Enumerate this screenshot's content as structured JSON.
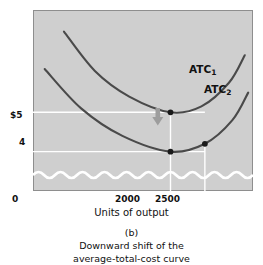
{
  "chart_data": {
    "type": "line",
    "title": "",
    "subtitle": "",
    "panel_label": "(b)",
    "caption_line1": "Downward shift of the",
    "caption_line2": "average-total-cost curve",
    "xlabel": "Units of output",
    "ylabel": "",
    "x_ticks": [
      "0",
      "2000",
      "2500"
    ],
    "x_tick_values": [
      0,
      2000,
      2500
    ],
    "y_ticks": [
      "$5",
      "4"
    ],
    "y_tick_values": [
      5,
      4
    ],
    "xlim": [
      0,
      3200
    ],
    "ylim": [
      3.0,
      7.6
    ],
    "grid": true,
    "grid_color": "#ffffff",
    "plot_background": "#cfcfcf",
    "axis_break": "wavy-line",
    "legend_position": "inline-right",
    "curve_color": "#4a4a4a",
    "arrow_color": "#9a9a9a",
    "series": [
      {
        "name": "ATC1",
        "label": "ATC",
        "subscript": "1",
        "points": [
          {
            "x": 450,
            "y": 7.05
          },
          {
            "x": 900,
            "y": 6.05
          },
          {
            "x": 1400,
            "y": 5.4
          },
          {
            "x": 2000,
            "y": 5.0
          },
          {
            "x": 2450,
            "y": 5.15
          },
          {
            "x": 2850,
            "y": 5.75
          },
          {
            "x": 3080,
            "y": 6.45
          }
        ]
      },
      {
        "name": "ATC2",
        "label": "ATC",
        "subscript": "2",
        "points": [
          {
            "x": 170,
            "y": 6.1
          },
          {
            "x": 700,
            "y": 5.1
          },
          {
            "x": 1300,
            "y": 4.4
          },
          {
            "x": 2000,
            "y": 4.0
          },
          {
            "x": 2500,
            "y": 4.2
          },
          {
            "x": 2900,
            "y": 4.8
          },
          {
            "x": 3130,
            "y": 5.5
          }
        ]
      }
    ],
    "markers": [
      {
        "x": 2000,
        "y": 5.0,
        "series": "ATC1"
      },
      {
        "x": 2000,
        "y": 4.0,
        "series": "ATC2"
      },
      {
        "x": 2500,
        "y": 4.2,
        "series": "ATC2"
      }
    ],
    "annotations": [
      {
        "type": "arrow",
        "direction": "down",
        "x": 2270,
        "y_from": 5.1,
        "y_to": 4.45
      }
    ]
  }
}
